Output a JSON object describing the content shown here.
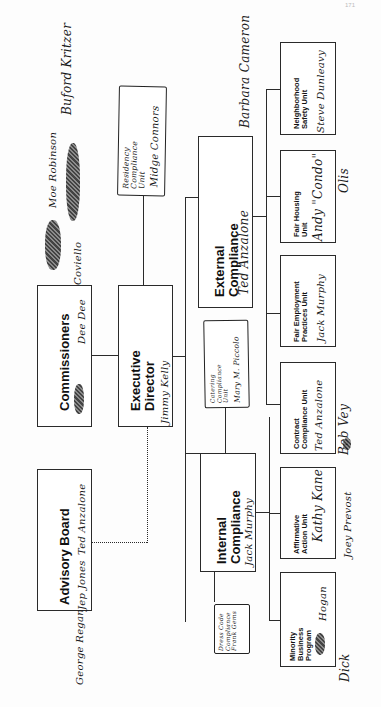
{
  "page": {
    "page_number": "171",
    "orientation": "rotated-90-ccw"
  },
  "chart": {
    "top_level": [
      {
        "id": "commissioners",
        "label": "Commissioners",
        "handwritten_names": [
          "Dee Dee",
          "Jep Jones (scribbled out)"
        ]
      },
      {
        "id": "advisory_board",
        "label": "Advisory Board",
        "handwritten_names": [
          "George Regan",
          "Jep Jones",
          "Ted Anzalone"
        ]
      }
    ],
    "executive_director": {
      "label_line1": "Executive",
      "label_line2": "Director",
      "handwritten_name": "Jimmy Kelly"
    },
    "divisions": [
      {
        "id": "external",
        "label_line1": "External",
        "label_line2": "Compliance",
        "handwritten_name": "Ted Anzalone",
        "side_note": "Barbara Cameron"
      },
      {
        "id": "internal",
        "label_line1": "Internal",
        "label_line2": "Compliance",
        "handwritten_name": "Jack Murphy"
      }
    ],
    "units": [
      {
        "label_line1": "Neighborhood",
        "label_line2": "Safety Unit",
        "handwritten_name": "Steve Dunleavy"
      },
      {
        "label_line1": "Fair Housing",
        "label_line2": "Unit",
        "handwritten_name": "Andy \"Condo\"",
        "handwritten_name2": "Olis"
      },
      {
        "label_line1": "Fair Employment",
        "label_line2": "Practices Unit",
        "handwritten_name": "Jack Murphy"
      },
      {
        "label_line1": "Contract",
        "label_line2": "Compliance Unit",
        "handwritten_name": "Ted Anzalone",
        "handwritten_name2": "Bob Vey"
      },
      {
        "label_line1": "Affirmative",
        "label_line2": "Action Unit",
        "handwritten_name": "Kathy Kane",
        "handwritten_name2": "Joey Prevost"
      },
      {
        "label_line1": "Minority",
        "label_line2": "Business",
        "label_line3": "Program",
        "handwritten_name": "Hogan",
        "handwritten_name2": "Dick"
      }
    ],
    "handwritten_notes": {
      "top_names_1": "Moe Robinson",
      "top_names_2": "Buford Kritzer",
      "coviello": "Coviello",
      "residency": {
        "line1": "Residency",
        "line2": "Compliance",
        "line3": "Unit",
        "name": "Midge Connors"
      },
      "catering": {
        "line1": "Catering",
        "line2": "Compliance",
        "line3": "Unit",
        "name": "Mary M. Piccolo"
      },
      "dress_code": {
        "line1": "Dress Code",
        "line2": "Compliance",
        "name": "Frank Gems"
      },
      "barbara": "Barbara Cameron",
      "george": "George Regan",
      "jep": "Jep Jones",
      "ted": "Ted Anzalone"
    }
  }
}
